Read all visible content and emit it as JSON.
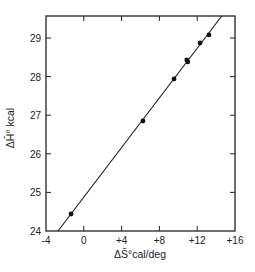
{
  "chart_data": {
    "type": "scatter",
    "title": "",
    "xlabel": "ΔS̄°cal/deg",
    "ylabel": "ΔH̄° kcal",
    "xlim": [
      -4,
      16
    ],
    "ylim": [
      24,
      29.57
    ],
    "grid": false,
    "legend": null,
    "x_ticks": [
      -4,
      0,
      4,
      8,
      12,
      16
    ],
    "x_tick_labels": [
      "-4",
      "0",
      "+4",
      "+8",
      "+12",
      "+16"
    ],
    "y_ticks": [
      24,
      25,
      26,
      27,
      28,
      29
    ],
    "y_tick_labels": [
      "24",
      "25",
      "26",
      "27",
      "28",
      "29"
    ],
    "series": [
      {
        "name": "data",
        "type": "scatter",
        "points": [
          {
            "x": -1.35,
            "y": 24.44
          },
          {
            "x": 6.26,
            "y": 26.85
          },
          {
            "x": 9.55,
            "y": 27.94
          },
          {
            "x": 10.9,
            "y": 28.43
          },
          {
            "x": 11.0,
            "y": 28.38
          },
          {
            "x": 12.3,
            "y": 28.87
          },
          {
            "x": 13.25,
            "y": 29.08
          }
        ]
      },
      {
        "name": "fit",
        "type": "line",
        "points": [
          {
            "x": -2.73,
            "y": 24.0
          },
          {
            "x": 14.6,
            "y": 29.57
          }
        ]
      }
    ]
  }
}
